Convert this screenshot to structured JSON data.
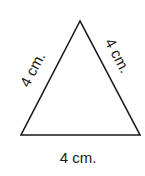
{
  "diagram": {
    "shape": "equilateral triangle",
    "stroke_color": "#1a1a1a",
    "background": "#ffffff",
    "vertices": {
      "top": [
        80,
        21
      ],
      "bottom_left": [
        21,
        135
      ],
      "bottom_right": [
        140,
        135
      ]
    },
    "labels": {
      "left_side": "4 cm.",
      "right_side": "4 cm.",
      "bottom_side": "4 cm."
    }
  }
}
